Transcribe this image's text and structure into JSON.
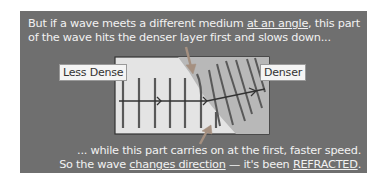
{
  "caption": {
    "line1_pre": "But if a wave meets a different medium ",
    "line1_u": "at an angle",
    "line1_post": ", this part",
    "line2": "of the wave hits the denser layer first and slows down...",
    "line3": "... while this part carries on at the first, faster speed.",
    "line4_pre": "So the wave ",
    "line4_u1": "changes direction",
    "line4_mid": " — it's been ",
    "line4_u2": "REFRACTED",
    "line4_post": "."
  },
  "labels": {
    "less_dense": "Less Dense",
    "denser": "Denser"
  },
  "colors": {
    "panel": "#6f6f6f",
    "less_dense_region": "#e2e2e2",
    "denser_region": "#b9b9b9",
    "wavefront": "#555555",
    "pointer_arrow": "#a08878"
  }
}
